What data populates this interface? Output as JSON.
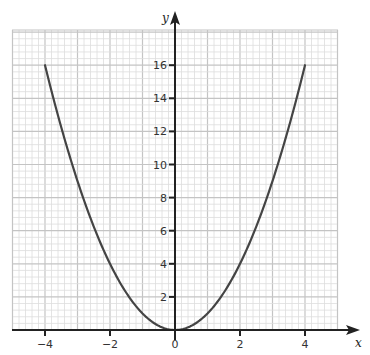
{
  "chart_data": {
    "type": "line",
    "title": "",
    "xlabel": "x",
    "ylabel": "y",
    "xlim": [
      -5,
      5
    ],
    "ylim": [
      0,
      18
    ],
    "grid": true,
    "x_ticks": [
      -4,
      -2,
      0,
      2,
      4
    ],
    "x_tick_labels": [
      "−4",
      "−2",
      "0",
      "2",
      "4"
    ],
    "y_ticks": [
      2,
      4,
      6,
      8,
      10,
      12,
      14,
      16
    ],
    "y_tick_labels": [
      "2",
      "4",
      "6",
      "8",
      "10",
      "12",
      "14",
      "16"
    ],
    "series": [
      {
        "name": "y = x²",
        "x": [
          -4,
          -3.5,
          -3,
          -2.5,
          -2,
          -1.5,
          -1,
          -0.5,
          0,
          0.5,
          1,
          1.5,
          2,
          2.5,
          3,
          3.5,
          4
        ],
        "values": [
          16,
          12.25,
          9,
          6.25,
          4,
          2.25,
          1,
          0.25,
          0,
          0.25,
          1,
          2.25,
          4,
          6.25,
          9,
          12.25,
          16
        ],
        "color": "#444444"
      }
    ]
  },
  "colors": {
    "curve": "#444444",
    "axis": "#222222",
    "grid_minor": "#dddddd",
    "grid_major": "#c4c4c4"
  }
}
